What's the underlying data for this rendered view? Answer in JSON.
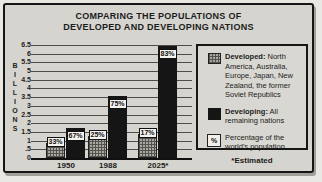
{
  "figure": {
    "title_line1": "COMPARING THE POPULATIONS OF",
    "title_line2": "DEVELOPED AND DEVELOPING NATIONS",
    "footnote": "*Estimated"
  },
  "legend": {
    "items": [
      {
        "swatch": "hatched-gray-square",
        "term": "Developed:",
        "rest": " North America, Australia, Europe, Japan, New Zealand, the former Soviet Republics"
      },
      {
        "swatch": "black-square",
        "term": "Developing:",
        "rest": " All remaining nations"
      },
      {
        "swatch": "percent-square",
        "symbol": "%",
        "term": "",
        "rest": "Percentage of the world's population"
      }
    ]
  },
  "chart_data": {
    "type": "bar",
    "title": "COMPARING THE POPULATIONS OF DEVELOPED AND DEVELOPING NATIONS",
    "xlabel": "",
    "ylabel": "BILLIONS",
    "ylim": [
      0,
      6.5
    ],
    "ytick_interval": 0.5,
    "ytick_labels": [
      "6.5",
      "6",
      "5.5",
      "5",
      "4.5",
      "4",
      "3.5",
      "3",
      "2.5",
      "2",
      "1.5",
      "1",
      ".5",
      "0"
    ],
    "grid": "horizontal",
    "legend_position": "right",
    "categories": [
      "1950",
      "1988",
      "2025*"
    ],
    "series": [
      {
        "name": "Developed",
        "style": "hatched-gray",
        "values": [
          0.85,
          1.25,
          1.4
        ],
        "bar_labels": [
          "33%",
          "25%",
          "17%"
        ]
      },
      {
        "name": "Developing",
        "style": "solid-black",
        "values": [
          1.7,
          3.55,
          6.45
        ],
        "bar_labels": [
          "67%",
          "75%",
          "83%"
        ]
      }
    ],
    "annotations": [
      "*Estimated"
    ],
    "colors": {
      "developing_bar": "#151515",
      "developed_bar_base": "#a9a7a1",
      "grid_line": "#4d4d4d",
      "background": "#d6d4ce"
    }
  }
}
